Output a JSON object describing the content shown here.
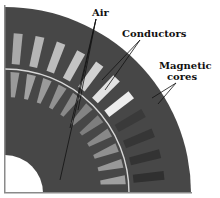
{
  "diagram": {
    "labels": {
      "air": "Air",
      "conductors": "Conductors",
      "magnetic_cores_line1": "Magnetic",
      "magnetic_cores_line2": "cores"
    },
    "colors": {
      "core": "#474747",
      "air_gap_line": "#d8d8d8",
      "inner_hole": "#ffffff",
      "leader": "#111111",
      "outer_slot_shades": [
        "#a9a9a9",
        "#b5b5b5",
        "#bdbdbd",
        "#c4c4c4",
        "#d2d2d2",
        "#e2e2e2",
        "#eeeeee",
        "#3a3a3a",
        "#363636",
        "#333333",
        "#303030"
      ],
      "inner_slot_shades": [
        "#9a9a9a",
        "#a2a2a2",
        "#9a9a9a",
        "#929292",
        "#8a8a8a",
        "#848484",
        "#7e7e7e",
        "#888888",
        "#909090",
        "#989898",
        "#a0a0a0"
      ]
    },
    "outer_slot_count": 11,
    "inner_slot_count": 11
  }
}
